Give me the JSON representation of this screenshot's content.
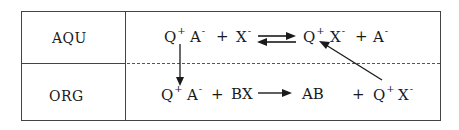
{
  "diagram": {
    "phases": [
      {
        "id": "aqueous",
        "label": "AQU"
      },
      {
        "id": "organic",
        "label": "ORG"
      }
    ],
    "aqueous_equation": {
      "left": [
        {
          "base": "Q",
          "charge": "+"
        },
        {
          "base": "A",
          "charge": "-"
        },
        {
          "op": "+"
        },
        {
          "base": "X",
          "charge": "-"
        }
      ],
      "arrow": "equilibrium",
      "right": [
        {
          "base": "Q",
          "charge": "+"
        },
        {
          "base": "X",
          "charge": "-"
        },
        {
          "op": "+"
        },
        {
          "base": "A",
          "charge": "-"
        }
      ]
    },
    "organic_equation": {
      "left": [
        {
          "base": "Q",
          "charge": "+"
        },
        {
          "base": "A",
          "charge": "-"
        },
        {
          "op": "+"
        },
        {
          "base": "BX"
        }
      ],
      "arrow": "forward",
      "right": [
        {
          "base": "AB"
        },
        {
          "op": "+"
        },
        {
          "base": "Q",
          "charge": "+"
        },
        {
          "base": "X",
          "charge": "-"
        }
      ]
    },
    "transfers": [
      {
        "from": "Q+A- (AQU)",
        "to": "Q+A- (ORG)",
        "direction": "down"
      },
      {
        "from": "Q+X- (ORG)",
        "to": "Q+X- (AQU)",
        "direction": "up-left"
      }
    ],
    "boundary_style": "dashed",
    "colors": {
      "line": "#444444",
      "text": "#1a1a1a",
      "background": "#ffffff"
    }
  },
  "text": {
    "aqu_q": "Q",
    "aqu_q_charge": "+",
    "aqu_a": "A",
    "aqu_a_charge": "-",
    "aqu_plus1": "+",
    "aqu_x": "X",
    "aqu_x_charge": "-",
    "aqu_q2": "Q",
    "aqu_q2_charge": "+",
    "aqu_x2": "X",
    "aqu_x2_charge": "-",
    "aqu_plus2": "+",
    "aqu_a2": "A",
    "aqu_a2_charge": "-",
    "org_q": "Q",
    "org_q_charge": "+",
    "org_a": "A",
    "org_a_charge": "-",
    "org_plus1": "+",
    "org_bx": "BX",
    "org_ab": "AB",
    "org_plus2": "+",
    "org_q2": "Q",
    "org_q2_charge": "+",
    "org_x2": "X",
    "org_x2_charge": "-"
  }
}
